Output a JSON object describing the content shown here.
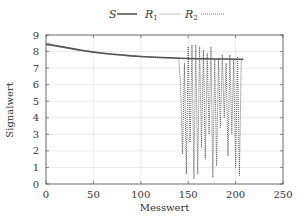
{
  "chart_data": {
    "type": "line",
    "title": "",
    "xlabel": "Messwert",
    "ylabel": "Signalwert",
    "xlim": [
      0,
      250
    ],
    "ylim": [
      0,
      9
    ],
    "xticks": [
      0,
      50,
      100,
      150,
      200,
      250
    ],
    "yticks": [
      0,
      1,
      2,
      3,
      4,
      5,
      6,
      7,
      8,
      9
    ],
    "grid": true,
    "legend_position": "top-center",
    "legend": [
      {
        "name": "S",
        "sub": "",
        "style": "solid",
        "color": "#555555"
      },
      {
        "name": "R",
        "sub": "1",
        "style": "solid",
        "color": "#bbbbbb"
      },
      {
        "name": "R",
        "sub": "2",
        "style": "dotted",
        "color": "#666666"
      }
    ],
    "series": [
      {
        "name": "S",
        "x": [
          0,
          10,
          20,
          30,
          40,
          50,
          60,
          70,
          80,
          90,
          100,
          110,
          120,
          130,
          140,
          150,
          160,
          170,
          180,
          190,
          200,
          208
        ],
        "y": [
          8.45,
          8.35,
          8.25,
          8.15,
          8.05,
          7.97,
          7.9,
          7.84,
          7.79,
          7.74,
          7.7,
          7.67,
          7.64,
          7.62,
          7.6,
          7.58,
          7.57,
          7.56,
          7.55,
          7.55,
          7.54,
          7.54
        ]
      },
      {
        "name": "R1",
        "x": [
          0,
          10,
          20,
          30,
          40,
          50,
          60,
          70,
          80,
          90,
          100,
          110,
          120,
          130,
          140,
          150,
          160,
          170,
          180,
          190,
          200,
          208
        ],
        "y": [
          8.42,
          8.33,
          8.23,
          8.13,
          8.04,
          7.96,
          7.89,
          7.83,
          7.78,
          7.73,
          7.69,
          7.66,
          7.63,
          7.61,
          7.59,
          7.57,
          7.56,
          7.55,
          7.55,
          7.54,
          7.54,
          7.54
        ]
      },
      {
        "name": "R2",
        "x": [
          0,
          10,
          20,
          30,
          40,
          50,
          60,
          70,
          80,
          90,
          100,
          110,
          120,
          130,
          140,
          142,
          144,
          146,
          148,
          150,
          152,
          154,
          156,
          158,
          160,
          162,
          164,
          166,
          168,
          170,
          172,
          174,
          176,
          178,
          180,
          182,
          184,
          186,
          188,
          190,
          192,
          194,
          196,
          198,
          200,
          202,
          204,
          206,
          208
        ],
        "y": [
          8.5,
          8.38,
          8.28,
          8.17,
          8.07,
          7.99,
          7.91,
          7.85,
          7.8,
          7.75,
          7.71,
          7.68,
          7.65,
          7.63,
          7.6,
          6.0,
          1.8,
          7.3,
          0.6,
          8.3,
          2.5,
          8.4,
          0.3,
          8.4,
          0.6,
          8.3,
          2.2,
          8.1,
          1.5,
          7.9,
          3.0,
          8.3,
          0.4,
          7.5,
          1.1,
          7.6,
          3.4,
          7.8,
          4.0,
          7.3,
          1.7,
          7.8,
          3.0,
          7.5,
          1.0,
          7.7,
          0.5,
          7.5,
          7.5
        ]
      }
    ]
  }
}
